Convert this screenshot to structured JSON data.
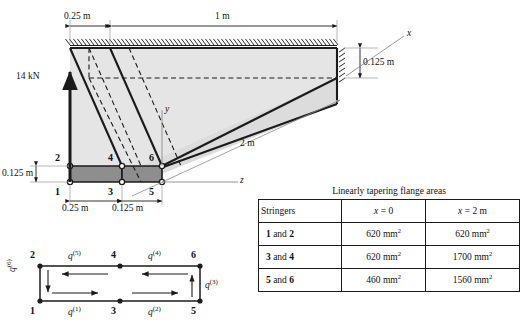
{
  "figure": {
    "dimensions": {
      "top_left_span": "0.25 m",
      "top_right_span": "1 m",
      "right_depth": "0.125 m",
      "left_depth": "0.125 m",
      "length": "2 m",
      "bottom_left_span": "0.25 m",
      "bottom_right_span": "0.125 m"
    },
    "load": "14 kN",
    "axes": {
      "x": "x",
      "y": "y",
      "z": "z"
    },
    "nodes": [
      "1",
      "2",
      "3",
      "4",
      "5",
      "6"
    ]
  },
  "shear_flow": {
    "nodes": {
      "n1": "1",
      "n2": "2",
      "n3": "3",
      "n4": "4",
      "n5": "5",
      "n6": "6"
    },
    "labels": {
      "q1": "q",
      "q1_sup": "(1)",
      "q2": "q",
      "q2_sup": "(2)",
      "q3": "q",
      "q3_sup": "(3)",
      "q4": "q",
      "q4_sup": "(4)",
      "q5": "q",
      "q5_sup": "(5)",
      "q6": "q",
      "q6_sup": "(6)"
    }
  },
  "table": {
    "title": "Linearly tapering flange areas",
    "headers": [
      "Stringers",
      "x = 0",
      "x = 2 m"
    ],
    "header_x0_var": "x",
    "header_x0_val": " = 0",
    "header_x2_var": "x",
    "header_x2_val": " = 2 m",
    "rows": [
      {
        "stringers_a": "1",
        "stringers_mid": " and ",
        "stringers_b": "2",
        "x0": "620 mm",
        "x0_sup": "2",
        "x2": "620 mm",
        "x2_sup": "2"
      },
      {
        "stringers_a": "3",
        "stringers_mid": " and ",
        "stringers_b": "4",
        "x0": "620 mm",
        "x0_sup": "2",
        "x2": "1700 mm",
        "x2_sup": "2"
      },
      {
        "stringers_a": "5",
        "stringers_mid": " and ",
        "stringers_b": "6",
        "x0": "460 mm",
        "x0_sup": "2",
        "x2": "1560 mm",
        "x2_sup": "2"
      }
    ]
  },
  "colors": {
    "line": "#1b1b1b",
    "face_light": "#e2e2e2",
    "face_dark": "#8e8e8e",
    "guide": "#9a9a9a"
  }
}
